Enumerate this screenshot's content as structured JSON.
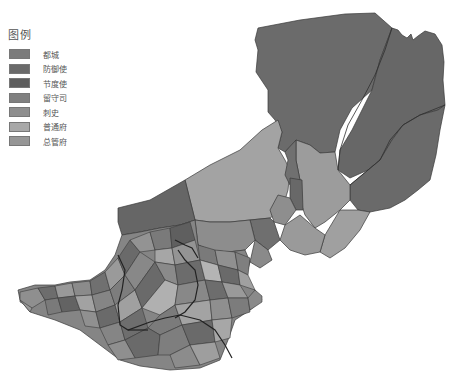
{
  "legend": {
    "title": "图例",
    "items": [
      {
        "label": "都城",
        "color": "#7b7b7b"
      },
      {
        "label": "防御使",
        "color": "#6a6a6a"
      },
      {
        "label": "节度使",
        "color": "#5e5e5e"
      },
      {
        "label": "留守司",
        "color": "#808080"
      },
      {
        "label": "刺史",
        "color": "#8e8e8e"
      },
      {
        "label": "普通府",
        "color": "#a8a8a8"
      },
      {
        "label": "总管府",
        "color": "#969696"
      }
    ]
  },
  "map": {
    "colors": {
      "north_large": "#6b6b6b",
      "northeast": "#666666",
      "east": "#6a6a6a",
      "central_plain": "#a5a5a5",
      "northwest_band": "#666666",
      "light_region": "#9f9f9f",
      "border": "#3a3a3a",
      "river": "#222222"
    }
  }
}
